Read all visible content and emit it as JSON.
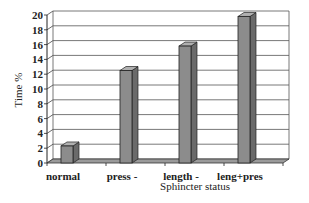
{
  "chart_data": {
    "type": "bar",
    "title": "",
    "xlabel": "Sphincter status",
    "ylabel": "Time %",
    "categories": [
      "normal",
      "press -",
      "length -",
      "leng+pres"
    ],
    "values": [
      2.3,
      12.5,
      15.8,
      19.8
    ],
    "ylim": [
      0,
      20
    ],
    "yticks": [
      0,
      2,
      4,
      6,
      8,
      10,
      12,
      14,
      16,
      18,
      20
    ],
    "grid": true,
    "legend": "none",
    "style": "3d-column",
    "bar_color": "#8c8c8c"
  }
}
